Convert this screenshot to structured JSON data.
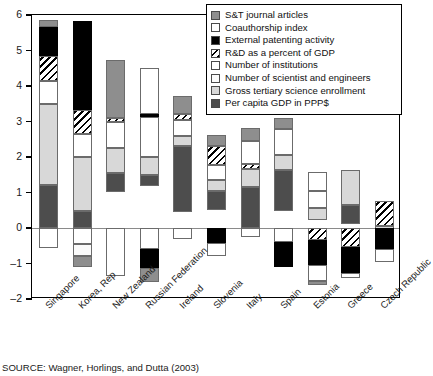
{
  "source_note": "SOURCE: Wagner, Horlings, and Dutta (2003)",
  "axes": {
    "ylabel": "STCI score",
    "yticks": [
      6,
      5,
      4,
      3,
      2,
      1,
      0,
      -1,
      -2
    ],
    "ytick_labels": [
      "6",
      "5",
      "4",
      "3",
      "2",
      "1",
      "0",
      "–1",
      "–2"
    ],
    "ylim": [
      -2,
      6
    ],
    "xlabel": ""
  },
  "legend": {
    "position": "top-right",
    "entries": [
      {
        "label": "S&T journal articles",
        "key": "st_journal_articles",
        "swatch": "medium-gray",
        "color": "#8e8e8e"
      },
      {
        "label": "Coauthorship index",
        "key": "coauthorship_index",
        "swatch": "white",
        "color": "#ffffff"
      },
      {
        "label": "External patenting activity",
        "key": "external_patenting",
        "swatch": "black",
        "color": "#000000"
      },
      {
        "label": "R&D as a percent of GDP",
        "key": "rd_percent_gdp",
        "swatch": "diagonal-hatch",
        "color": "#000000"
      },
      {
        "label": "Number of institutions",
        "key": "num_institutions",
        "swatch": "white",
        "color": "#ffffff"
      },
      {
        "label": "Number of scientist and engineers",
        "key": "num_scientists",
        "swatch": "white",
        "color": "#fbfbfb"
      },
      {
        "label": "Gross tertiary science enrollment",
        "key": "tertiary_enrollment",
        "swatch": "light-gray",
        "color": "#d8d8d8"
      },
      {
        "label": "Per capita GDP in PPP$",
        "key": "per_capita_gdp",
        "swatch": "dark-gray",
        "color": "#4d4d4d"
      }
    ]
  },
  "chart_data": {
    "type": "bar",
    "title": "",
    "subtitle": "",
    "xlabel": "",
    "ylabel": "STCI score",
    "ylim": [
      -2,
      6
    ],
    "grid": false,
    "stacked": true,
    "legend_position": "top-right",
    "categories": [
      "Singapore",
      "Korea, Rep",
      "New Zealand",
      "Russian Federation",
      "Ireland",
      "Slovenia",
      "Italy",
      "Spain",
      "Estonia",
      "Greece",
      "Czech Republic"
    ],
    "series": [
      {
        "name": "S&T journal articles",
        "values": [
          0.22,
          0.0,
          1.62,
          0.0,
          0.52,
          0.32,
          0.36,
          0.3,
          0.0,
          0.0,
          0.0
        ]
      },
      {
        "name": "Coauthorship index",
        "values": [
          0.0,
          0.0,
          0.0,
          1.28,
          0.0,
          0.0,
          0.65,
          0.75,
          0.52,
          0.0,
          0.0
        ]
      },
      {
        "name": "External patenting activity",
        "values": [
          0.8,
          2.5,
          0.0,
          0.1,
          0.0,
          0.0,
          0.0,
          0.0,
          0.0,
          0.0,
          0.0
        ]
      },
      {
        "name": "R&D as a percent of GDP",
        "values": [
          0.72,
          0.68,
          0.12,
          0.0,
          0.17,
          0.53,
          0.14,
          0.0,
          0.0,
          0.0,
          0.7
        ]
      },
      {
        "name": "Number of institutions",
        "values": [
          0.65,
          0.65,
          0.72,
          1.12,
          0.45,
          0.43,
          0.0,
          0.0,
          0.5,
          0.0,
          0.0
        ]
      },
      {
        "name": "Number of scientist and engineers",
        "values": [
          0.0,
          0.0,
          0.0,
          0.0,
          0.0,
          0.0,
          0.0,
          0.0,
          0.0,
          0.0,
          0.0
        ]
      },
      {
        "name": "Gross tertiary science enrollment",
        "values": [
          2.28,
          1.52,
          0.7,
          0.5,
          0.28,
          0.31,
          0.51,
          0.42,
          0.32,
          0.97,
          0.15
        ]
      },
      {
        "name": "Per capita GDP in PPP$",
        "values": [
          1.2,
          0.48,
          0.55,
          0.33,
          1.85,
          0.53,
          1.15,
          1.15,
          0.0,
          0.55,
          0.1
        ]
      }
    ],
    "bar_totals_positive": [
      5.87,
      5.83,
      4.72,
      4.5,
      3.73,
      2.62,
      2.82,
      3.1,
      1.57,
      1.62,
      0.75
    ],
    "bar_mins_negative": [
      -0.55,
      -1.1,
      -1.35,
      -1.53,
      -0.32,
      -0.78,
      -0.25,
      -1.1,
      -1.6,
      -1.42,
      -0.97
    ],
    "negative_segments": {
      "Singapore": [
        {
          "name": "Number of institutions",
          "from": 0.0,
          "to": -0.55
        }
      ],
      "Korea, Rep": [
        {
          "name": "Number of institutions",
          "from": 0.0,
          "to": -0.45
        },
        {
          "name": "Number of scientist and engineers",
          "from": -0.45,
          "to": -0.78
        },
        {
          "name": "S&T journal articles",
          "from": -0.78,
          "to": -1.1
        }
      ],
      "New Zealand": [
        {
          "name": "Number of institutions",
          "from": 0.0,
          "to": -1.35
        }
      ],
      "Russian Federation": [
        {
          "name": "Number of institutions",
          "from": 0.0,
          "to": -0.6
        },
        {
          "name": "External patenting activity",
          "from": -0.6,
          "to": -1.13
        },
        {
          "name": "S&T journal articles",
          "from": -1.13,
          "to": -1.53
        }
      ],
      "Ireland": [
        {
          "name": "Number of institutions",
          "from": 0.0,
          "to": -0.32
        }
      ],
      "Slovenia": [
        {
          "name": "External patenting activity",
          "from": 0.0,
          "to": -0.42
        },
        {
          "name": "Number of institutions",
          "from": -0.42,
          "to": -0.78
        }
      ],
      "Italy": [
        {
          "name": "Number of institutions",
          "from": 0.0,
          "to": -0.25
        }
      ],
      "Spain": [
        {
          "name": "Number of institutions",
          "from": 0.0,
          "to": -0.4
        },
        {
          "name": "External patenting activity",
          "from": -0.4,
          "to": -1.1
        }
      ],
      "Estonia": [
        {
          "name": "R&D as a percent of GDP",
          "from": 0.0,
          "to": -0.35
        },
        {
          "name": "External patenting activity",
          "from": -0.35,
          "to": -1.05
        },
        {
          "name": "Number of institutions",
          "from": -1.05,
          "to": -1.48
        },
        {
          "name": "S&T journal articles",
          "from": -1.48,
          "to": -1.6
        }
      ],
      "Greece": [
        {
          "name": "R&D as a percent of GDP",
          "from": 0.0,
          "to": -0.53
        },
        {
          "name": "External patenting activity",
          "from": -0.53,
          "to": -1.27
        },
        {
          "name": "Number of institutions",
          "from": -1.27,
          "to": -1.42
        }
      ],
      "Czech Republic": [
        {
          "name": "External patenting activity",
          "from": 0.0,
          "to": -0.6
        },
        {
          "name": "Number of institutions",
          "from": -0.6,
          "to": -0.97
        }
      ]
    }
  }
}
